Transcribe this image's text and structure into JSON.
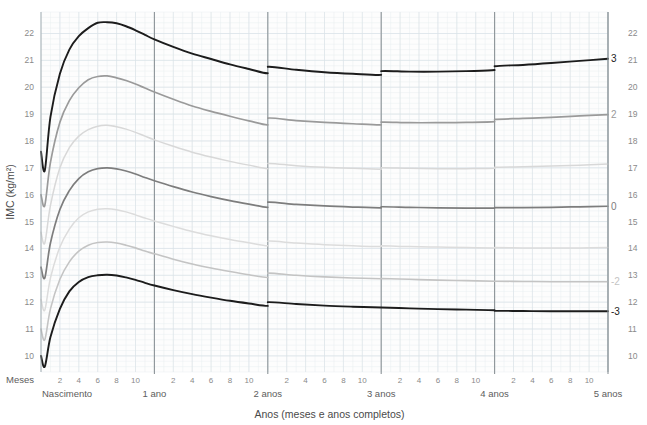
{
  "chart_data": {
    "type": "line",
    "title": "",
    "subtitle": "",
    "xlabel": "Anos (meses e anos completos)",
    "ylabel": "IMC (kg/m²)",
    "ylim": [
      9.4,
      22.8
    ],
    "xlim": [
      0,
      60
    ],
    "grid": true,
    "legend_position": "right-inline",
    "y_ticks": [
      10,
      11,
      12,
      13,
      14,
      15,
      16,
      17,
      18,
      19,
      20,
      21,
      22
    ],
    "y_ticks_right": [
      10,
      11,
      12,
      13,
      14,
      15,
      16,
      17,
      18,
      19,
      20,
      21,
      22
    ],
    "x_axis_units": "months",
    "x_month_ticks": [
      2,
      4,
      6,
      8,
      10
    ],
    "x_year_boundaries": [
      {
        "months": 0,
        "label": "Nascimento"
      },
      {
        "months": 12,
        "label": "1 ano"
      },
      {
        "months": 24,
        "label": "2 anos"
      },
      {
        "months": 36,
        "label": "3 anos"
      },
      {
        "months": 48,
        "label": "4 anos"
      },
      {
        "months": 60,
        "label": "5 anos"
      }
    ],
    "row_label_months": "Meses",
    "series": [
      {
        "name": "3",
        "label": "3",
        "color": "#1c1c1c",
        "width": 1.9,
        "points_months": [
          0,
          0.4,
          1,
          2,
          3,
          4,
          5,
          6,
          7,
          8,
          9,
          10,
          11,
          12,
          14,
          16,
          18,
          20,
          22,
          24,
          24,
          27,
          30,
          33,
          36,
          36,
          39,
          42,
          45,
          48,
          48,
          51,
          54,
          57,
          60
        ],
        "values": [
          17.6,
          16.9,
          18.9,
          20.5,
          21.4,
          21.9,
          22.2,
          22.4,
          22.42,
          22.38,
          22.27,
          22.12,
          21.95,
          21.78,
          21.5,
          21.25,
          21.05,
          20.85,
          20.68,
          20.52,
          20.76,
          20.65,
          20.56,
          20.5,
          20.46,
          20.6,
          20.58,
          20.58,
          20.6,
          20.64,
          20.78,
          20.83,
          20.9,
          20.98,
          21.06
        ]
      },
      {
        "name": "2",
        "label": "2",
        "color": "#9a9a9a",
        "width": 1.7,
        "points_months": [
          0,
          0.4,
          1,
          2,
          3,
          4,
          5,
          6,
          7,
          8,
          9,
          10,
          11,
          12,
          14,
          16,
          18,
          20,
          22,
          24,
          24,
          27,
          30,
          33,
          36,
          36,
          39,
          42,
          45,
          48,
          48,
          51,
          54,
          57,
          60
        ],
        "values": [
          16.0,
          15.6,
          17.2,
          18.7,
          19.5,
          19.98,
          20.28,
          20.4,
          20.42,
          20.35,
          20.25,
          20.12,
          19.97,
          19.82,
          19.55,
          19.3,
          19.1,
          18.92,
          18.75,
          18.6,
          18.85,
          18.76,
          18.69,
          18.64,
          18.6,
          18.7,
          18.68,
          18.68,
          18.69,
          18.72,
          18.8,
          18.84,
          18.88,
          18.93,
          18.98
        ]
      },
      {
        "name": "1",
        "label": "",
        "color": "#d8d8d8",
        "width": 1.5,
        "points_months": [
          0,
          0.4,
          1,
          2,
          3,
          4,
          5,
          6,
          7,
          8,
          9,
          10,
          11,
          12,
          14,
          16,
          18,
          20,
          22,
          24,
          24,
          27,
          30,
          33,
          36,
          36,
          39,
          42,
          45,
          48,
          48,
          51,
          54,
          57,
          60
        ],
        "values": [
          14.6,
          14.2,
          15.6,
          17.0,
          17.75,
          18.18,
          18.42,
          18.55,
          18.58,
          18.53,
          18.44,
          18.32,
          18.18,
          18.04,
          17.8,
          17.58,
          17.4,
          17.24,
          17.1,
          16.97,
          17.16,
          17.08,
          17.02,
          16.98,
          16.95,
          17.0,
          16.98,
          16.97,
          16.97,
          16.98,
          17.02,
          17.04,
          17.07,
          17.1,
          17.14
        ]
      },
      {
        "name": "0",
        "label": "0",
        "color": "#7d7d7d",
        "width": 1.7,
        "points_months": [
          0,
          0.4,
          1,
          2,
          3,
          4,
          5,
          6,
          7,
          8,
          9,
          10,
          11,
          12,
          14,
          16,
          18,
          20,
          22,
          24,
          24,
          27,
          30,
          33,
          36,
          36,
          39,
          42,
          45,
          48,
          48,
          51,
          54,
          57,
          60
        ],
        "values": [
          13.3,
          12.9,
          14.2,
          15.45,
          16.15,
          16.6,
          16.85,
          16.97,
          17.0,
          16.96,
          16.88,
          16.77,
          16.64,
          16.52,
          16.3,
          16.1,
          15.93,
          15.78,
          15.65,
          15.53,
          15.72,
          15.64,
          15.58,
          15.54,
          15.51,
          15.55,
          15.53,
          15.51,
          15.5,
          15.5,
          15.52,
          15.52,
          15.53,
          15.55,
          15.57
        ]
      },
      {
        "name": "-1",
        "label": "",
        "color": "#dcdcdc",
        "width": 1.5,
        "points_months": [
          0,
          0.4,
          1,
          2,
          3,
          4,
          5,
          6,
          7,
          8,
          9,
          10,
          11,
          12,
          14,
          16,
          18,
          20,
          22,
          24,
          24,
          27,
          30,
          33,
          36,
          36,
          39,
          42,
          45,
          48,
          48,
          51,
          54,
          57,
          60
        ],
        "values": [
          12.1,
          11.7,
          12.9,
          14.05,
          14.72,
          15.14,
          15.36,
          15.46,
          15.48,
          15.44,
          15.36,
          15.25,
          15.13,
          15.02,
          14.82,
          14.63,
          14.47,
          14.33,
          14.21,
          14.1,
          14.27,
          14.2,
          14.14,
          14.1,
          14.07,
          14.1,
          14.07,
          14.05,
          14.03,
          14.02,
          14.03,
          14.02,
          14.02,
          14.02,
          14.03
        ]
      },
      {
        "name": "-2",
        "label": "-2",
        "color": "#c4c4c4",
        "width": 1.6,
        "points_months": [
          0,
          0.4,
          1,
          2,
          3,
          4,
          5,
          6,
          7,
          8,
          9,
          10,
          11,
          12,
          14,
          16,
          18,
          20,
          22,
          24,
          24,
          27,
          30,
          33,
          36,
          36,
          39,
          42,
          45,
          48,
          48,
          51,
          54,
          57,
          60
        ],
        "values": [
          11.0,
          10.6,
          11.75,
          12.85,
          13.5,
          13.9,
          14.12,
          14.22,
          14.24,
          14.2,
          14.12,
          14.02,
          13.9,
          13.8,
          13.6,
          13.42,
          13.27,
          13.14,
          13.02,
          12.92,
          13.08,
          13.0,
          12.94,
          12.9,
          12.87,
          12.88,
          12.85,
          12.82,
          12.8,
          12.78,
          12.78,
          12.77,
          12.76,
          12.76,
          12.76
        ]
      },
      {
        "name": "-3",
        "label": "-3",
        "color": "#1c1c1c",
        "width": 1.9,
        "points_months": [
          0,
          0.4,
          1,
          2,
          3,
          4,
          5,
          6,
          7,
          8,
          9,
          10,
          11,
          12,
          14,
          16,
          18,
          20,
          22,
          24,
          24,
          27,
          30,
          33,
          36,
          36,
          39,
          42,
          45,
          48,
          48,
          51,
          54,
          57,
          60
        ],
        "values": [
          10.0,
          9.6,
          10.7,
          11.75,
          12.4,
          12.75,
          12.93,
          13.0,
          13.02,
          12.99,
          12.92,
          12.83,
          12.72,
          12.62,
          12.45,
          12.3,
          12.17,
          12.05,
          11.95,
          11.86,
          12.0,
          11.93,
          11.87,
          11.83,
          11.8,
          11.8,
          11.77,
          11.74,
          11.72,
          11.7,
          11.68,
          11.67,
          11.66,
          11.66,
          11.66
        ]
      }
    ]
  },
  "colors": {
    "background": "#ffffff",
    "panel": "#fdfdfd",
    "grid_minor": "#e9eef1",
    "grid_major": "#d9e1e6",
    "axis_line": "#9aa3a8",
    "year_line": "#8d9498",
    "tick_text": "#8a8a8a",
    "title_text": "#4a4a4a"
  }
}
